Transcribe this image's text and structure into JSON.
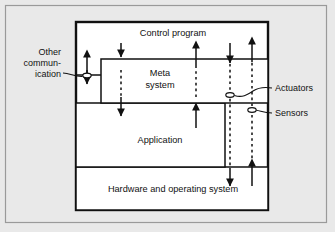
{
  "diagram": {
    "type": "block-diagram",
    "canvas": {
      "width": 335,
      "height": 232,
      "background": "#e9e9e9"
    },
    "frame": {
      "name": "outer-frame",
      "stroke": "#8d8d8d"
    },
    "blocks": [
      {
        "id": "control-program",
        "label": "Control program",
        "label_x": 173,
        "label_y": 36,
        "rect": {
          "x": 76,
          "y": 22,
          "w": 192,
          "h": 188
        },
        "fill": "#ffffff",
        "stroke": "#111111",
        "stroke_width": 2.2
      },
      {
        "id": "meta-system",
        "label_line1": "Meta",
        "label_line2": "system",
        "label_x": 160,
        "label_y": 76,
        "rect": {
          "x": 101,
          "y": 59,
          "w": 167,
          "h": 44
        },
        "fill": "#ffffff",
        "stroke": "#111111",
        "stroke_width": 1.4
      },
      {
        "id": "application",
        "label": "Application",
        "label_x": 160,
        "label_y": 143,
        "rect": {
          "x": 76,
          "y": 103,
          "w": 149,
          "h": 64
        },
        "fill": "#ffffff",
        "stroke": "#111111",
        "stroke_width": 1.4
      },
      {
        "id": "hardware-os",
        "label": "Hardware and operating system",
        "label_x": 173,
        "label_y": 192,
        "rect": {
          "x": 76,
          "y": 167,
          "w": 192,
          "h": 43
        },
        "fill": "#ffffff",
        "stroke": "#111111",
        "stroke_width": 1.4
      }
    ],
    "annotations": [
      {
        "id": "other-communication",
        "line1": "Other",
        "line2": "commun-",
        "line3": "ication",
        "x": 61,
        "y": 58,
        "anchor": "end",
        "target_port": {
          "x": 87,
          "y": 75
        }
      },
      {
        "id": "actuators",
        "label": "Actuators",
        "x": 276,
        "y": 90,
        "anchor": "start",
        "target_port": {
          "x": 230,
          "y": 95
        }
      },
      {
        "id": "sensors",
        "label": "Sensors",
        "x": 276,
        "y": 115,
        "anchor": "start",
        "target_port": {
          "x": 252,
          "y": 110
        }
      }
    ],
    "connectors": [
      {
        "id": "cp-to-meta-down",
        "x": 121,
        "direction": "down",
        "style": "solid-then-dashed"
      },
      {
        "id": "meta-to-app-down",
        "x": 121,
        "direction": "down",
        "style": "arrow-out"
      },
      {
        "id": "app-to-meta-up",
        "x": 196,
        "direction": "up",
        "style": "solid-then-dashed"
      },
      {
        "id": "meta-to-cp-up",
        "x": 196,
        "direction": "up",
        "style": "arrow-out"
      },
      {
        "id": "actuator-chain-down",
        "x": 230,
        "direction": "down",
        "style": "solid-dashed-solid"
      },
      {
        "id": "sensor-chain-up",
        "x": 252,
        "direction": "up",
        "style": "solid-dashed-solid"
      },
      {
        "id": "other-comm-bidirectional",
        "x": 87,
        "direction": "both",
        "style": "solid"
      }
    ],
    "ports": [
      {
        "id": "other-comm-port",
        "x": 87,
        "y": 75
      },
      {
        "id": "actuators-port",
        "x": 230,
        "y": 95
      },
      {
        "id": "sensors-port",
        "x": 252,
        "y": 110
      }
    ]
  }
}
